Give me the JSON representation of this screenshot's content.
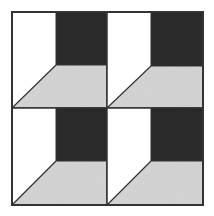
{
  "figure": {
    "grid": {
      "rows": 2,
      "cols": 2
    },
    "colors": {
      "background": "#ffffff",
      "white_panel": "#ffffff",
      "dark_square": "#2b2b2b",
      "gray_floor": "#d6d6d6",
      "outline": "#333333"
    },
    "blocks": [
      {
        "x": 12,
        "y": 12,
        "w": 95,
        "h": 96,
        "split_x": 56,
        "split_y": 65
      },
      {
        "x": 107,
        "y": 12,
        "w": 96,
        "h": 96,
        "split_x": 151,
        "split_y": 66
      },
      {
        "x": 12,
        "y": 108,
        "w": 95,
        "h": 97,
        "split_x": 56,
        "split_y": 161
      },
      {
        "x": 107,
        "y": 108,
        "w": 96,
        "h": 97,
        "split_x": 151,
        "split_y": 161
      }
    ]
  }
}
